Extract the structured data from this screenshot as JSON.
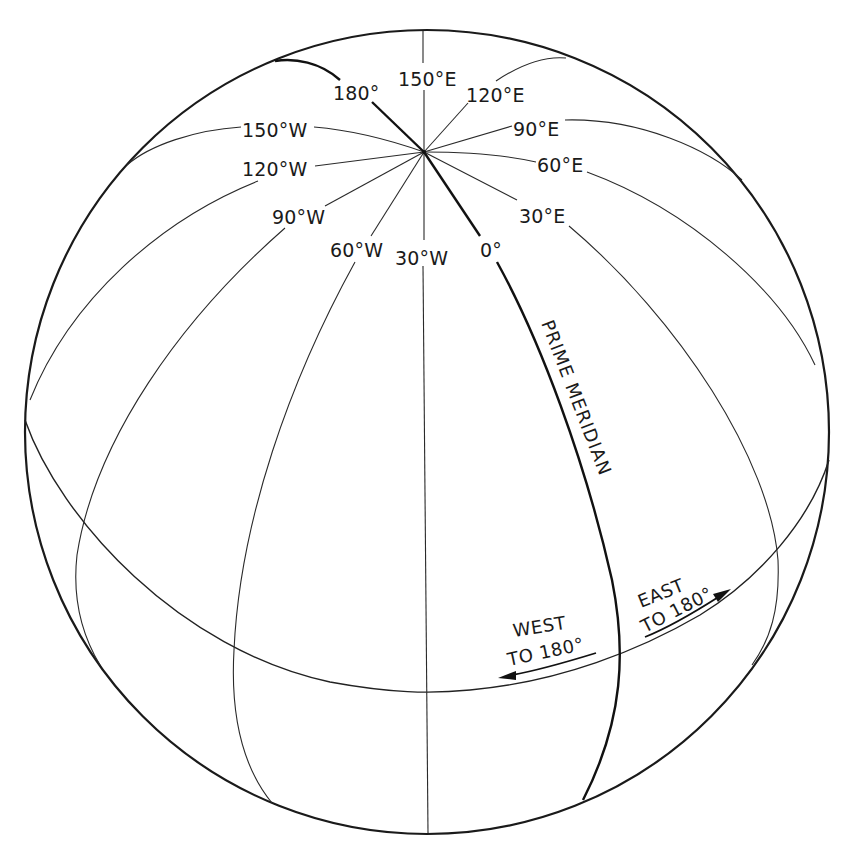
{
  "diagram": {
    "colors": {
      "background": "#ffffff",
      "line": "#1a1a1a"
    },
    "meridian_labels": {
      "m180": "180°",
      "m150e": "150°E",
      "m120e": "120°E",
      "m90e": "90°E",
      "m60e": "60°E",
      "m30e": "30°E",
      "m0": "0°",
      "m30w": "30°W",
      "m60w": "60°W",
      "m90w": "90°W",
      "m120w": "120°W",
      "m150w": "150°W"
    },
    "prime_meridian_label": "PRIME MERIDIAN",
    "west_annotation": {
      "line1": "WEST",
      "line2": "TO  180°"
    },
    "east_annotation": {
      "line1": "EAST",
      "line2": "TO  180°"
    }
  }
}
